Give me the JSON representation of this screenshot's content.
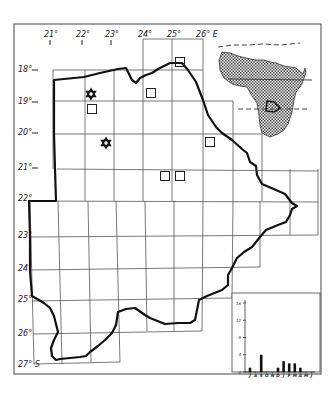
{
  "figure": {
    "frame_color": "#444444",
    "outline_color": "#111111",
    "grid_color": "#555555",
    "hatch_color": "#555555"
  },
  "longitude_labels": [
    {
      "text": "21°",
      "x": 51
    },
    {
      "text": "22°",
      "x": 83
    },
    {
      "text": "23°",
      "x": 112
    },
    {
      "text": "24°",
      "x": 145
    },
    {
      "text": "25°",
      "x": 174
    },
    {
      "text": "26° E",
      "x": 207
    }
  ],
  "latitude_labels": [
    {
      "text": "18°",
      "y": 72
    },
    {
      "text": "19°",
      "y": 104
    },
    {
      "text": "20°",
      "y": 135
    },
    {
      "text": "21°",
      "y": 170
    },
    {
      "text": "22°",
      "y": 201
    },
    {
      "text": "23°",
      "y": 238
    },
    {
      "text": "24°",
      "y": 271
    },
    {
      "text": "25°",
      "y": 302
    },
    {
      "text": "26°",
      "y": 336
    },
    {
      "text": "27° S",
      "y": 367
    }
  ],
  "markers": {
    "squares": [
      {
        "x": 180,
        "y": 62
      },
      {
        "x": 151,
        "y": 93
      },
      {
        "x": 92,
        "y": 109
      },
      {
        "x": 210,
        "y": 142
      },
      {
        "x": 165,
        "y": 176
      },
      {
        "x": 180,
        "y": 176
      }
    ],
    "stars": [
      {
        "x": 91,
        "y": 94
      },
      {
        "x": 106,
        "y": 143
      }
    ]
  },
  "inset_map": {
    "label": "Africa locator",
    "highlight": "Botswana"
  },
  "chart_data": {
    "type": "bar",
    "title": "",
    "categories": [
      "J",
      "A",
      "S",
      "O",
      "N",
      "D",
      "J",
      "F",
      "M",
      "A",
      "M",
      "J"
    ],
    "values": [
      1,
      0,
      4,
      0,
      0,
      1,
      2.5,
      2,
      2,
      1,
      0,
      0
    ],
    "yticks": [
      "0",
      "4",
      "8",
      "12",
      "16"
    ],
    "ylim": [
      0,
      16
    ],
    "xlabel": "",
    "ylabel": ""
  }
}
